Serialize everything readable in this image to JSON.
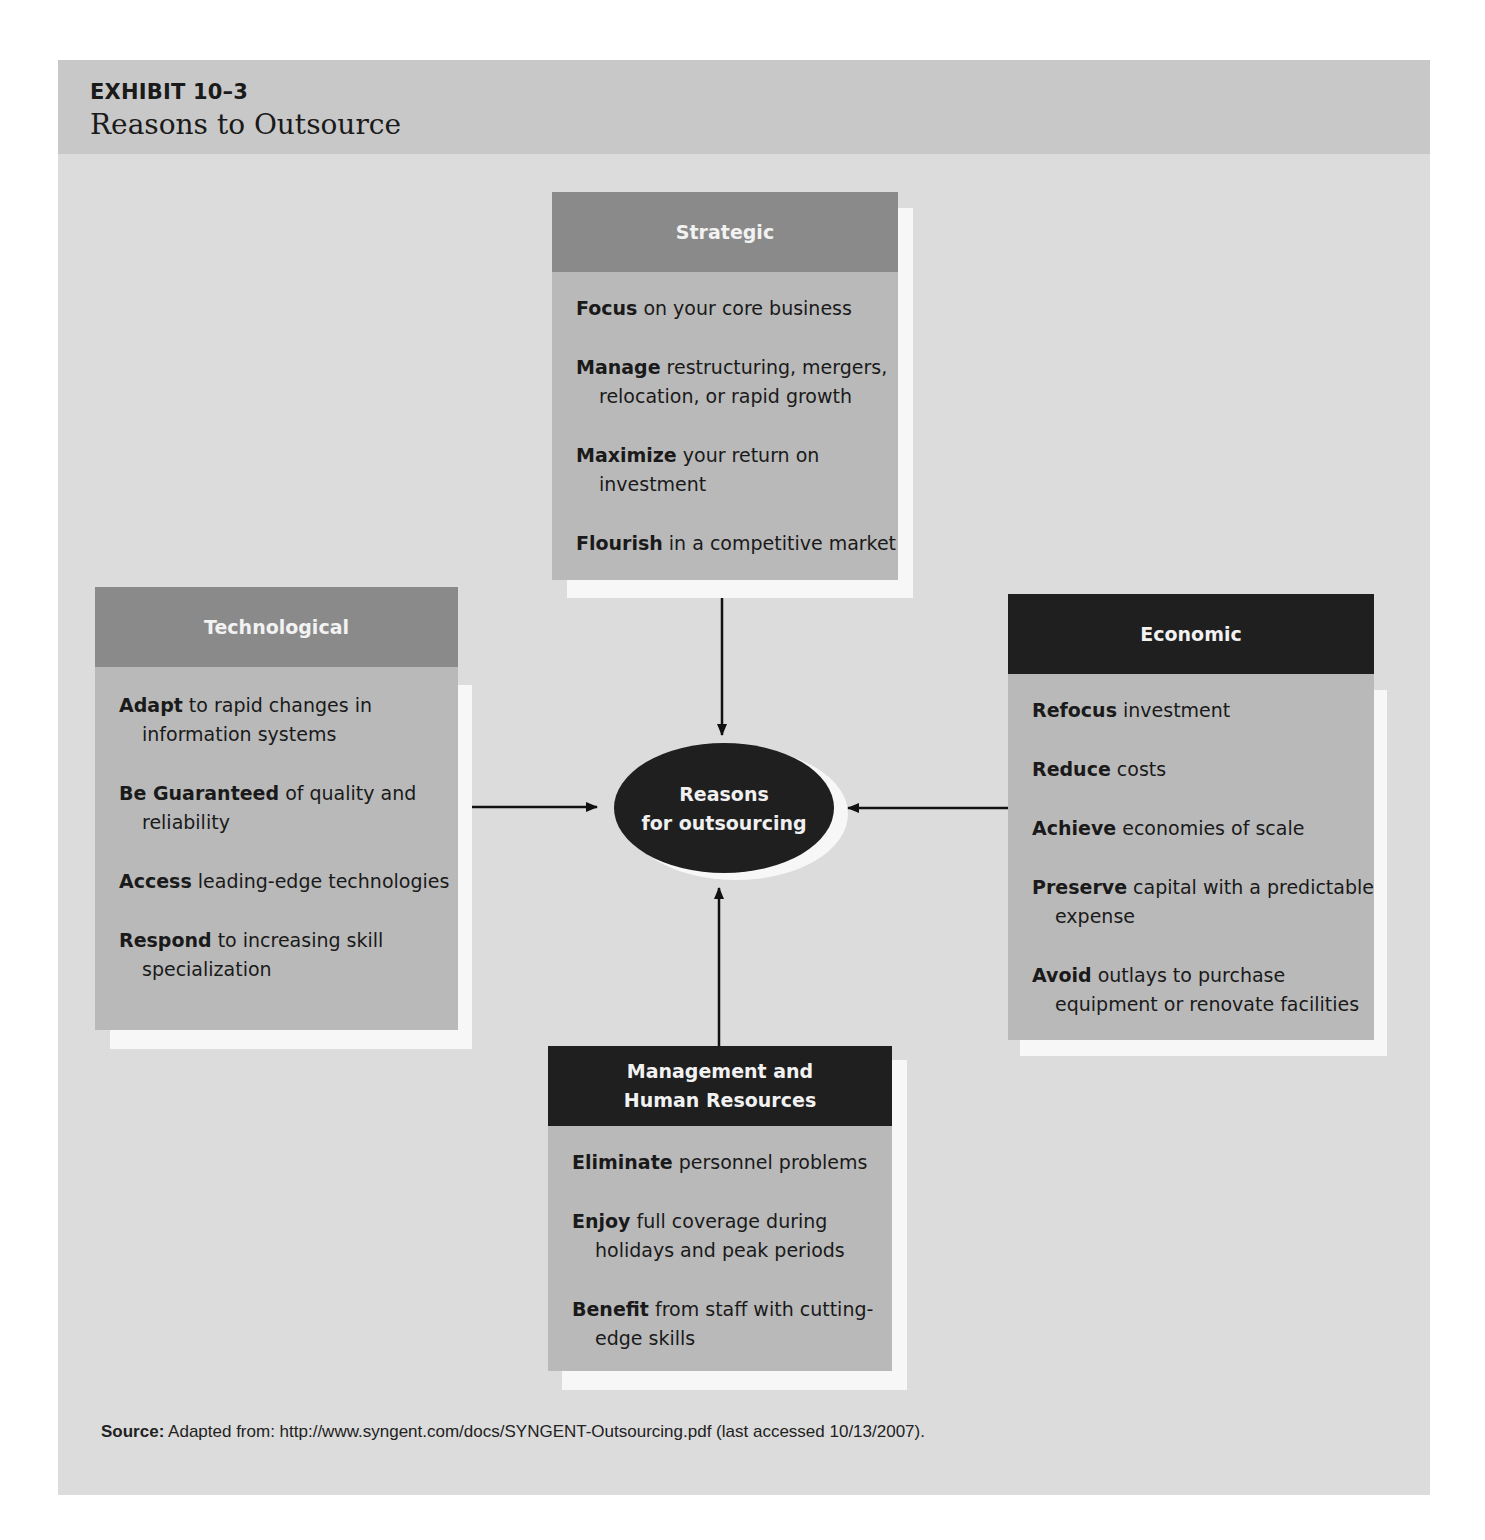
{
  "exhibit": {
    "label": "EXHIBIT 10–3",
    "title": "Reasons to Outsource"
  },
  "center": {
    "line1": "Reasons",
    "line2": "for outsourcing"
  },
  "boxes": {
    "strategic": {
      "title": "Strategic",
      "items": [
        {
          "bold": "Focus",
          "rest": " on your core business"
        },
        {
          "bold": "Manage",
          "rest": " restructuring, mergers, relocation, or rapid growth"
        },
        {
          "bold": "Maximize",
          "rest": " your return on investment"
        },
        {
          "bold": "Flourish",
          "rest": " in a competitive market"
        }
      ]
    },
    "technological": {
      "title": "Technological",
      "items": [
        {
          "bold": "Adapt",
          "rest": " to rapid changes in information systems"
        },
        {
          "bold": "Be Guaranteed",
          "rest": " of quality and reliability"
        },
        {
          "bold": "Access",
          "rest": " leading-edge technologies"
        },
        {
          "bold": "Respond",
          "rest": " to increasing skill specialization"
        }
      ]
    },
    "economic": {
      "title": "Economic",
      "items": [
        {
          "bold": "Refocus",
          "rest": " investment"
        },
        {
          "bold": "Reduce",
          "rest": " costs"
        },
        {
          "bold": "Achieve",
          "rest": " economies of scale"
        },
        {
          "bold": "Preserve",
          "rest": " capital with a predictable expense"
        },
        {
          "bold": "Avoid",
          "rest": " outlays to purchase equipment or renovate facilities"
        }
      ]
    },
    "management": {
      "title_line1": "Management and",
      "title_line2": "Human Resources",
      "items": [
        {
          "bold": "Eliminate",
          "rest": " personnel problems"
        },
        {
          "bold": "Enjoy",
          "rest": " full coverage during holidays and peak periods"
        },
        {
          "bold": "Benefit",
          "rest": " from staff with cutting-edge skills"
        }
      ]
    }
  },
  "source": {
    "label": "Source:",
    "text": " Adapted from: http://www.syngent.com/docs/SYNGENT-Outsourcing.pdf (last accessed 10/13/2007)."
  },
  "colors": {
    "panel": "#dcdcdc",
    "title_bar": "#c8c8c8",
    "box_body": "#b9b9b9",
    "header_mid": "#8a8a8a",
    "header_dark": "#1f1f1f",
    "ellipse": "#1f1f1f",
    "shadow": "#f7f7f7"
  }
}
